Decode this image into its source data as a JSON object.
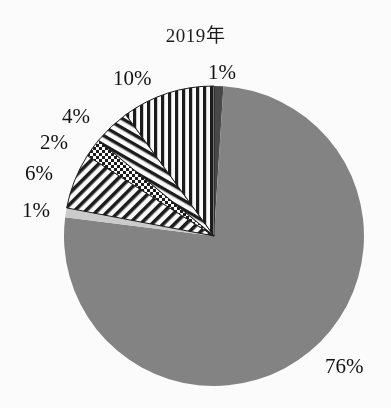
{
  "chart_data": {
    "type": "pie",
    "title": "2019年",
    "xlabel": "",
    "ylabel": "",
    "legend": "none",
    "grid": false,
    "start_angle_deg": 0,
    "direction": "clockwise",
    "center": {
      "x": 214,
      "y": 236
    },
    "radius": 150,
    "categories": [
      "1%",
      "76%",
      "1%",
      "6%",
      "2%",
      "4%",
      "10%"
    ],
    "values": [
      1,
      76,
      1,
      6,
      2,
      4,
      10
    ],
    "slices": [
      {
        "label": "1%",
        "value": 1,
        "fill_kind": "solid",
        "color": "#4a4a4a",
        "start_deg": 0,
        "end_deg": 3.6,
        "label_x": 208,
        "label_y": 62
      },
      {
        "label": "76%",
        "value": 76,
        "fill_kind": "solid",
        "color": "#858585",
        "start_deg": 3.6,
        "end_deg": 277.2,
        "label_x": 325,
        "label_y": 356
      },
      {
        "label": "1%",
        "value": 1,
        "fill_kind": "solid",
        "color": "#cfcfcf",
        "start_deg": 277.2,
        "end_deg": 280.8,
        "label_x": 22,
        "label_y": 200
      },
      {
        "label": "6%",
        "value": 6,
        "fill_kind": "diagonal-stripes",
        "color": "#1a1a1a",
        "start_deg": 280.8,
        "end_deg": 302.4,
        "label_x": 25,
        "label_y": 163
      },
      {
        "label": "2%",
        "value": 2,
        "fill_kind": "checkerboard",
        "color": "#1a1a1a",
        "start_deg": 302.4,
        "end_deg": 309.6,
        "label_x": 40,
        "label_y": 132
      },
      {
        "label": "4%",
        "value": 4,
        "fill_kind": "chevron-stripes",
        "color": "#1a1a1a",
        "start_deg": 309.6,
        "end_deg": 324.0,
        "label_x": 62,
        "label_y": 106
      },
      {
        "label": "10%",
        "value": 10,
        "fill_kind": "vertical-stripes",
        "color": "#1a1a1a",
        "start_deg": 324.0,
        "end_deg": 360.0,
        "label_x": 113,
        "label_y": 68
      }
    ],
    "colors": {
      "slice_dark_gray": "#4a4a4a",
      "slice_medium_gray": "#858585",
      "slice_light_gray": "#cfcfcf",
      "pattern_ink": "#1a1a1a",
      "background": "#ffffff",
      "text": "#121212"
    }
  }
}
